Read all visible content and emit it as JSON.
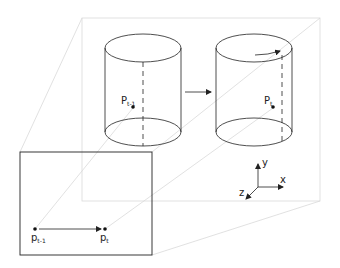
{
  "diagram": {
    "colors": {
      "stroke": "#222222",
      "guide": "#d6d6d6",
      "background": "#ffffff"
    },
    "labels": {
      "P_prev": {
        "base": "P",
        "sub": "t-1"
      },
      "P_curr": {
        "base": "P",
        "sub": "t"
      },
      "p_prev": {
        "base": "p",
        "sub": "t-1"
      },
      "p_curr": {
        "base": "p",
        "sub": "t"
      },
      "axis_x": "x",
      "axis_y": "y",
      "axis_z": "z"
    },
    "nodes": [
      {
        "id": "cylinder-t-1",
        "type": "cylinder",
        "contains": "P_prev"
      },
      {
        "id": "cylinder-t",
        "type": "cylinder",
        "contains": "P_curr",
        "annotation": "rotation arrow on top face"
      },
      {
        "id": "image-plane",
        "type": "rectangle",
        "contains": [
          "p_prev",
          "p_curr"
        ]
      },
      {
        "id": "axes",
        "type": "coordinate-frame",
        "axes": [
          "x",
          "y",
          "z"
        ]
      }
    ],
    "edges": [
      {
        "from": "cylinder-t-1",
        "to": "cylinder-t",
        "type": "arrow"
      },
      {
        "from": "p_prev",
        "to": "p_curr",
        "type": "arrow"
      },
      {
        "from": "P_prev",
        "to": "p_prev",
        "type": "projection-line"
      },
      {
        "from": "P_curr",
        "to": "p_curr",
        "type": "projection-line"
      }
    ]
  }
}
